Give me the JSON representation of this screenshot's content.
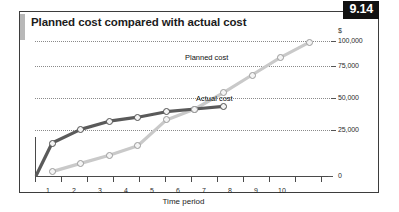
{
  "figure": {
    "number": "9.14",
    "title": "Planned cost compared with actual cost"
  },
  "chart_data": {
    "type": "line",
    "title": "Planned cost compared with actual cost",
    "xlabel": "Time period",
    "ylabel": "$",
    "x": [
      1,
      2,
      3,
      4,
      5,
      6,
      7,
      8,
      9,
      10
    ],
    "xtick_labels": [
      "1",
      "2",
      "3",
      "4",
      "5",
      "6",
      "7",
      "8",
      "9",
      "10"
    ],
    "ytick_labels": [
      "0",
      "25,000",
      "50,000",
      "75,000",
      "100,000"
    ],
    "yticks": [
      0,
      25000,
      50000,
      75000,
      100000
    ],
    "ylim": [
      0,
      100000
    ],
    "xlim": [
      0.4,
      10.8
    ],
    "grid": true,
    "legend": "inline-annotations",
    "series": [
      {
        "name": "Actual cost",
        "color": "#4f4f4f",
        "values": [
          25000,
          35000,
          41000,
          44000,
          48000,
          50000,
          52000,
          null,
          null,
          null
        ],
        "annotation": "Actual cost"
      },
      {
        "name": "Planned cost",
        "color": "#c3c3c3",
        "values": [
          4000,
          10000,
          16000,
          23000,
          42000,
          50000,
          62000,
          75000,
          88000,
          99000
        ],
        "annotation": "Planned cost"
      }
    ]
  }
}
